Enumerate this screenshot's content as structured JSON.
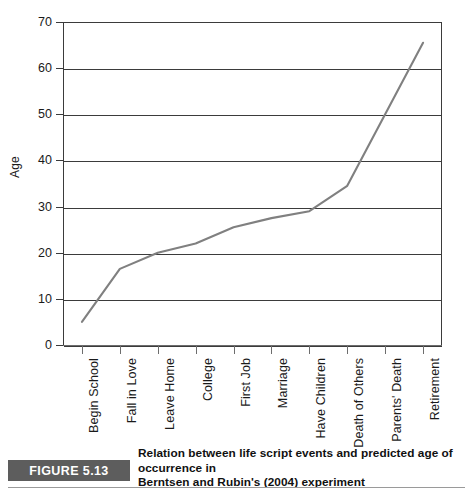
{
  "figure": {
    "badge_label": "FIGURE 5.13",
    "caption_line_1": "Relation between life script events and predicted age of occurrence in",
    "caption_line_2": "Berntsen and Rubin's (2004) experiment"
  },
  "colors": {
    "line": "#808080",
    "axis": "#3b3b3b",
    "grid": "#3b3b3b",
    "badge_background": "#5d5d5d",
    "badge_text": "#ffffff",
    "plot_background": "#ffffff"
  },
  "chart_data": {
    "type": "line",
    "title": "",
    "subtitle": "",
    "xlabel": "",
    "ylabel": "Age",
    "ylim": [
      0,
      70
    ],
    "yticks": [
      0,
      10,
      20,
      30,
      40,
      50,
      60,
      70
    ],
    "ytick_labels": [
      "0",
      "10",
      "20",
      "30",
      "40",
      "50",
      "60",
      "70"
    ],
    "grid": "horizontal",
    "legend": "none",
    "categories": [
      "Begin School",
      "Fall in Love",
      "Leave Home",
      "College",
      "First Job",
      "Marriage",
      "Have Children",
      "Death of Others",
      "Parents' Death",
      "Retirement"
    ],
    "values": [
      5,
      16.5,
      20,
      22,
      25.5,
      27.5,
      29,
      34.5,
      50,
      65.5
    ],
    "series": [
      {
        "name": "Predicted age of occurrence",
        "values": [
          5,
          16.5,
          20,
          22,
          25.5,
          27.5,
          29,
          34.5,
          50,
          65.5
        ]
      }
    ]
  }
}
